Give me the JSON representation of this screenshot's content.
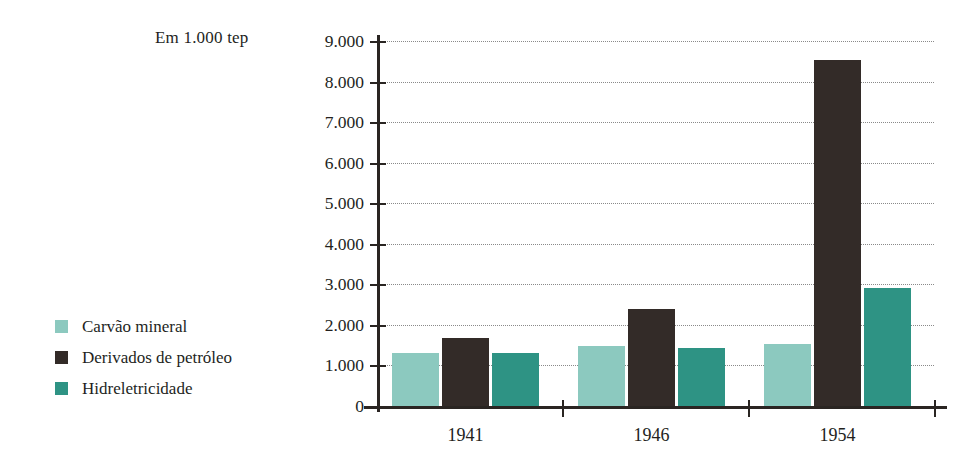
{
  "unit_caption": "Em 1.000 tep",
  "legend": {
    "items": [
      {
        "label": "Carvão mineral",
        "color": "#8cc9bf"
      },
      {
        "label": "Derivados de petróleo",
        "color": "#332b28"
      },
      {
        "label": "Hidreletricidade",
        "color": "#2e9384"
      }
    ]
  },
  "chart_data": {
    "type": "bar",
    "title": "Em 1.000 tep",
    "xlabel": "",
    "ylabel": "Em 1.000 tep",
    "categories": [
      "1941",
      "1946",
      "1954"
    ],
    "series": [
      {
        "name": "Carvão mineral",
        "color": "#8cc9bf",
        "values": [
          1300,
          1470,
          1520
        ]
      },
      {
        "name": "Derivados de petróleo",
        "color": "#332b28",
        "values": [
          1680,
          2380,
          8520
        ]
      },
      {
        "name": "Hidreletricidade",
        "color": "#2e9384",
        "values": [
          1300,
          1440,
          2920
        ]
      }
    ],
    "ylim": [
      0,
      9000
    ],
    "ytick_values": [
      0,
      1000,
      2000,
      3000,
      4000,
      5000,
      6000,
      7000,
      8000,
      9000
    ],
    "ytick_labels": [
      "0",
      "1.000",
      "2.000",
      "3.000",
      "4.000",
      "5.000",
      "6.000",
      "7.000",
      "8.000",
      "9.000"
    ],
    "grid": true,
    "legend_position": "left"
  },
  "axis_colors": {
    "axis_line": "#2a2522",
    "gridline": "#8a8a8a"
  }
}
